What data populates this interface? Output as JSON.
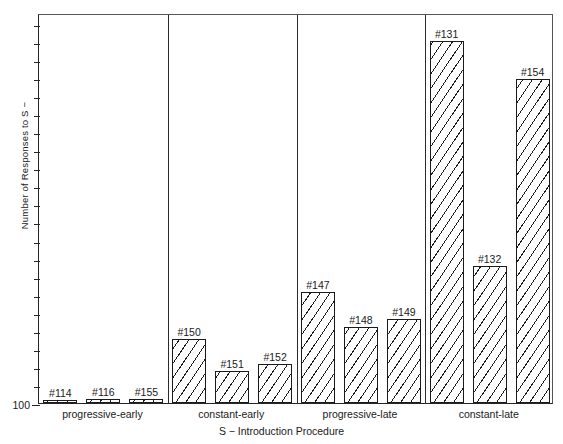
{
  "chart_data": {
    "type": "bar",
    "title": "",
    "xlabel": "S −  Introduction Procedure",
    "ylabel": "Number of Responses to S −",
    "ylim": [
      100,
      5500
    ],
    "grid": false,
    "legend": "none",
    "ytick_labels": [
      "100",
      "1000",
      "2000",
      "3000",
      "4000"
    ],
    "ytick_values": [
      100,
      1000,
      2000,
      3000,
      4000
    ],
    "minor_tick_interval": 250,
    "categories": [
      "#114",
      "#116",
      "#155",
      "#150",
      "#151",
      "#152",
      "#147",
      "#148",
      "#149",
      "#131",
      "#132",
      "#154"
    ],
    "values": [
      140,
      150,
      160,
      990,
      545,
      640,
      1640,
      1155,
      1270,
      5115,
      2000,
      4585
    ],
    "groups": [
      {
        "name": "progressive-early",
        "bars": [
          {
            "label": "#114",
            "value": 140
          },
          {
            "label": "#116",
            "value": 150
          },
          {
            "label": "#155",
            "value": 160
          }
        ]
      },
      {
        "name": "constant-early",
        "bars": [
          {
            "label": "#150",
            "value": 990
          },
          {
            "label": "#151",
            "value": 545
          },
          {
            "label": "#152",
            "value": 640
          }
        ]
      },
      {
        "name": "progressive-late",
        "bars": [
          {
            "label": "#147",
            "value": 1640
          },
          {
            "label": "#148",
            "value": 1155
          },
          {
            "label": "#149",
            "value": 1270
          }
        ]
      },
      {
        "name": "constant-late",
        "bars": [
          {
            "label": "#131",
            "value": 5115
          },
          {
            "label": "#132",
            "value": 2000
          },
          {
            "label": "#154",
            "value": 4585
          }
        ]
      }
    ]
  },
  "colors": {
    "axis": "#1a1a1a",
    "bar_outline": "#1a1a1a",
    "bar_fill": "#ffffff",
    "hatch": "#1a1a1a",
    "background": "#ffffff"
  }
}
